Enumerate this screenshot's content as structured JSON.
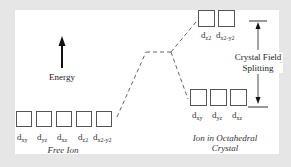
{
  "diagram": {
    "energy_label": "Energy",
    "free_ion": {
      "caption": "Free Ion",
      "orbitals": [
        {
          "main": "d",
          "sub": "xy"
        },
        {
          "main": "d",
          "sub": "yz"
        },
        {
          "main": "d",
          "sub": "xz"
        },
        {
          "main": "d",
          "sub": "z2"
        },
        {
          "main": "d",
          "sub": "x2-y2"
        }
      ]
    },
    "octahedral": {
      "caption_line1": "Ion in Octahedral",
      "caption_line2": "Crystal",
      "upper_orbitals": [
        {
          "main": "d",
          "sub": "z2"
        },
        {
          "main": "d",
          "sub": "x2-y2"
        }
      ],
      "lower_orbitals": [
        {
          "main": "d",
          "sub": "xy"
        },
        {
          "main": "d",
          "sub": "yz"
        },
        {
          "main": "d",
          "sub": "xz"
        }
      ]
    },
    "splitting_label_line1": "Crystal Field",
    "splitting_label_line2": "Splitting",
    "colors": {
      "background": "#e6e6e6",
      "panel": "#ffffff",
      "lines": "#555555",
      "text": "#333333"
    }
  }
}
